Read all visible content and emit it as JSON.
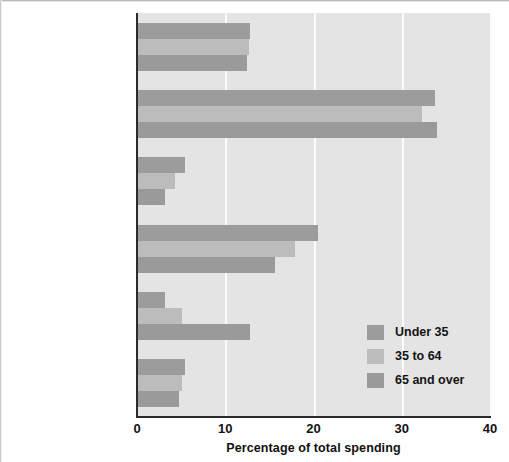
{
  "chart_data": {
    "type": "bar",
    "orientation": "horizontal",
    "title": "",
    "xlabel": "Percentage of total spending",
    "ylabel": "",
    "xlim": [
      0,
      40
    ],
    "xticks": [
      "0",
      "10",
      "20",
      "30",
      "40"
    ],
    "grid": "vertical-gridlines-at-xticks",
    "legend_position": "inside-lower-right",
    "categories": [
      "Food",
      "Housing",
      "Apparel and services",
      "Transportation",
      "Health care",
      "Entertainment"
    ],
    "series": [
      {
        "name": "Under 35",
        "color": "#9c9c9c",
        "values": [
          12.8,
          33.8,
          5.4,
          20.5,
          3.2,
          5.4
        ]
      },
      {
        "name": "35 to 64",
        "color": "#bcbcbc",
        "values": [
          12.7,
          32.3,
          4.3,
          17.9,
          5.1,
          5.1
        ]
      },
      {
        "name": "65 and over",
        "color": "#9a9a9a",
        "values": [
          12.5,
          34.0,
          3.2,
          15.6,
          12.8,
          4.8
        ]
      }
    ]
  },
  "legend": {
    "items": [
      {
        "label": "Under 35"
      },
      {
        "label": "35 to 64"
      },
      {
        "label": "65 and over"
      }
    ]
  },
  "colors": {
    "plot_background": "#e4e4e4",
    "gridline": "#fbfbfb",
    "axis": "#2b2b2b",
    "text": "#141414"
  }
}
